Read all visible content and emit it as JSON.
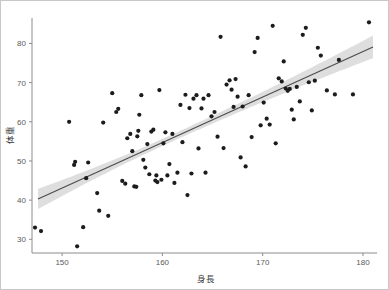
{
  "figure": {
    "background_color": "#ffffff",
    "border_color": "#c8c8c8",
    "width": 389,
    "height": 290
  },
  "chart_data": {
    "type": "scatter",
    "title": "",
    "subtitle": "",
    "xlabel": "身長",
    "ylabel": "体重",
    "xlim": [
      147.0,
      181.2
    ],
    "ylim": [
      26.5,
      86.5
    ],
    "xticks": [
      150,
      160,
      170,
      180
    ],
    "xtick_labels": [
      "150",
      "160",
      "170",
      "180"
    ],
    "yticks": [
      30,
      40,
      50,
      60,
      70,
      80
    ],
    "ytick_labels": [
      "30",
      "40",
      "50",
      "60",
      "70",
      "80"
    ],
    "grid": false,
    "legend": null,
    "legend_position": "none",
    "point_color": "#1c1c1c",
    "point_size": 2.1,
    "fit": {
      "type": "linear-regression",
      "line_color": "#4d4d4d",
      "band_color": "#c9c9c9",
      "band_label": "95% confidence interval",
      "x_start": 147.6,
      "y_start": 40.3,
      "x_end": 181.0,
      "y_end": 79.1,
      "slope": 1.162,
      "intercept": -131.2,
      "band_halfwidth_start": 2.6,
      "band_halfwidth_mid": 0.9,
      "band_halfwidth_end": 2.9,
      "band_min_x": 160.8
    },
    "x": [
      147.3,
      147.9,
      150.7,
      151.2,
      151.3,
      151.5,
      152.1,
      152.4,
      152.6,
      153.5,
      153.7,
      154.1,
      154.6,
      155.0,
      155.4,
      155.6,
      156.0,
      156.3,
      156.5,
      156.8,
      157.0,
      157.2,
      157.4,
      157.5,
      157.6,
      157.7,
      157.9,
      158.1,
      158.3,
      158.5,
      158.7,
      158.9,
      159.1,
      159.3,
      159.4,
      159.5,
      159.7,
      159.9,
      160.1,
      160.3,
      160.5,
      160.7,
      161.0,
      161.2,
      161.5,
      161.8,
      162.0,
      162.3,
      162.5,
      162.7,
      162.9,
      163.1,
      163.4,
      163.6,
      163.9,
      164.1,
      164.3,
      164.6,
      164.9,
      165.2,
      165.5,
      165.8,
      166.1,
      166.4,
      166.7,
      166.9,
      167.1,
      167.3,
      167.5,
      167.8,
      168.0,
      168.3,
      168.6,
      168.9,
      169.2,
      169.5,
      169.8,
      170.1,
      170.4,
      170.7,
      171.0,
      171.3,
      171.6,
      171.9,
      172.1,
      172.3,
      172.5,
      172.7,
      172.9,
      173.1,
      173.4,
      173.7,
      174.0,
      174.3,
      174.6,
      174.9,
      175.2,
      175.5,
      175.8,
      176.4,
      177.2,
      177.6,
      179.0,
      180.6
    ],
    "y": [
      33.0,
      32.1,
      60.0,
      49.0,
      49.8,
      28.2,
      33.1,
      45.6,
      49.6,
      41.8,
      37.3,
      59.8,
      36.0,
      67.3,
      62.5,
      63.3,
      44.9,
      44.2,
      55.8,
      56.9,
      52.5,
      43.5,
      43.4,
      56.3,
      57.7,
      61.8,
      66.8,
      50.3,
      48.3,
      54.3,
      46.6,
      57.5,
      58.0,
      45.0,
      46.3,
      44.6,
      68.1,
      45.2,
      54.5,
      57.3,
      46.3,
      49.2,
      56.9,
      44.4,
      47.0,
      64.3,
      54.8,
      66.9,
      41.3,
      63.5,
      46.8,
      65.9,
      66.8,
      53.2,
      63.4,
      65.9,
      47.0,
      66.8,
      61.4,
      62.5,
      56.2,
      81.7,
      53.3,
      69.5,
      70.6,
      68.2,
      63.8,
      70.9,
      66.4,
      50.9,
      63.9,
      48.6,
      66.8,
      56.1,
      77.8,
      81.4,
      59.1,
      64.9,
      60.8,
      59.3,
      84.5,
      54.5,
      71.1,
      70.3,
      75.4,
      68.5,
      67.9,
      68.4,
      63.1,
      60.6,
      68.9,
      65.2,
      82.2,
      84.0,
      70.1,
      62.9,
      70.5,
      78.9,
      76.9,
      68.0,
      67.0,
      75.8,
      67.0,
      85.4
    ]
  }
}
